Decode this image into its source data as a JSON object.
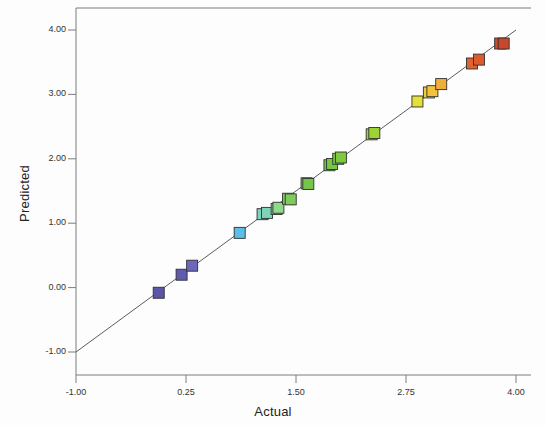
{
  "chart_data": {
    "type": "scatter",
    "title": "",
    "xlabel": "Actual",
    "ylabel": "Predicted",
    "xlim": [
      -1.0,
      4.0
    ],
    "ylim": [
      -1.0,
      4.0
    ],
    "xticks": [
      "-1.00",
      "0.25",
      "1.50",
      "2.75",
      "4.00"
    ],
    "xtick_values": [
      -1.0,
      0.25,
      1.5,
      2.75,
      4.0
    ],
    "yticks": [
      "4.00",
      "3.00",
      "2.00",
      "1.00",
      "0.00",
      "-1.00"
    ],
    "ytick_values": [
      4.0,
      3.0,
      2.0,
      1.0,
      0.0,
      -1.0
    ],
    "grid": false,
    "legend": "none",
    "reference_line": {
      "name": "identity-line",
      "from": [
        -1.0,
        -1.0
      ],
      "to": [
        4.0,
        4.0
      ],
      "color": "#4a4a4a"
    },
    "marker": {
      "shape": "square",
      "size": 11,
      "edge_color": "#303030"
    },
    "points": [
      {
        "x": -0.06,
        "y": -0.08,
        "color": "#5b56a8"
      },
      {
        "x": 0.2,
        "y": 0.2,
        "color": "#5f5cb0"
      },
      {
        "x": 0.32,
        "y": 0.34,
        "color": "#6a67bd"
      },
      {
        "x": 0.86,
        "y": 0.85,
        "color": "#59bfe8"
      },
      {
        "x": 1.12,
        "y": 1.14,
        "color": "#79d3c0"
      },
      {
        "x": 1.17,
        "y": 1.16,
        "color": "#7fd4b6"
      },
      {
        "x": 1.28,
        "y": 1.22,
        "color": "#8ed98f"
      },
      {
        "x": 1.3,
        "y": 1.24,
        "color": "#90da8b"
      },
      {
        "x": 1.41,
        "y": 1.38,
        "color": "#7ecb5e"
      },
      {
        "x": 1.44,
        "y": 1.37,
        "color": "#7fcc5c"
      },
      {
        "x": 1.62,
        "y": 1.62,
        "color": "#76c64e"
      },
      {
        "x": 1.64,
        "y": 1.61,
        "color": "#77c64c"
      },
      {
        "x": 1.88,
        "y": 1.9,
        "color": "#74c545"
      },
      {
        "x": 1.91,
        "y": 1.92,
        "color": "#76c744"
      },
      {
        "x": 1.98,
        "y": 2.0,
        "color": "#7ac83f"
      },
      {
        "x": 2.01,
        "y": 2.02,
        "color": "#7dca3e"
      },
      {
        "x": 2.36,
        "y": 2.38,
        "color": "#98d338"
      },
      {
        "x": 2.39,
        "y": 2.4,
        "color": "#9cd436"
      },
      {
        "x": 2.88,
        "y": 2.89,
        "color": "#e3e03a"
      },
      {
        "x": 3.01,
        "y": 3.03,
        "color": "#f2c93c"
      },
      {
        "x": 3.05,
        "y": 3.05,
        "color": "#f4c23b"
      },
      {
        "x": 3.15,
        "y": 3.16,
        "color": "#f0ae3a"
      },
      {
        "x": 3.5,
        "y": 3.48,
        "color": "#e0622f"
      },
      {
        "x": 3.58,
        "y": 3.54,
        "color": "#dd5a2c"
      },
      {
        "x": 3.82,
        "y": 3.79,
        "color": "#cf4b28"
      },
      {
        "x": 3.86,
        "y": 3.79,
        "color": "#c9472a"
      }
    ]
  },
  "axes": {
    "frame_color": "#7d7d7d",
    "x_title": "Actual",
    "y_title": "Predicted"
  }
}
